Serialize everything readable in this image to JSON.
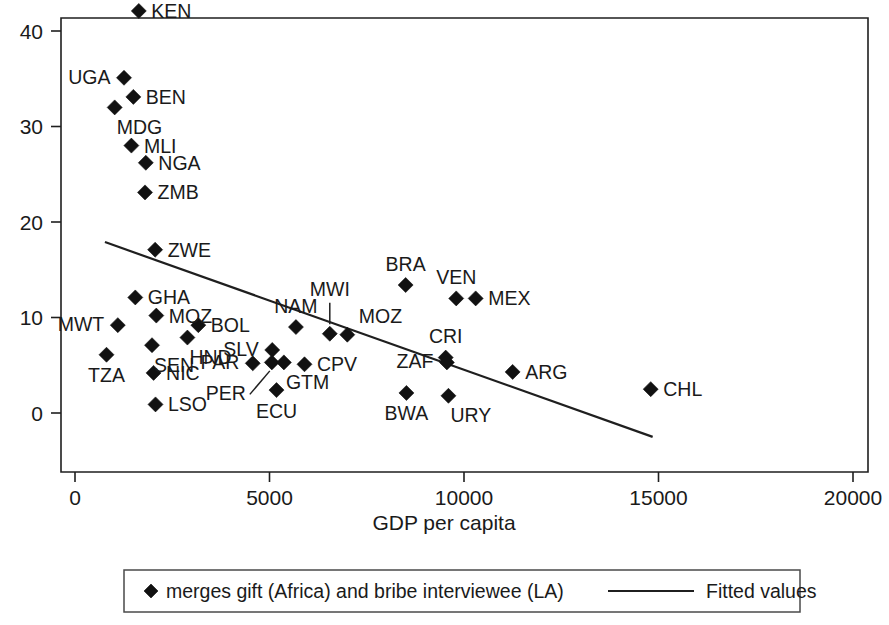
{
  "chart_data": {
    "type": "scatter",
    "title": "",
    "xlabel": "GDP per capita",
    "ylabel": "",
    "xlim": [
      0,
      20000
    ],
    "ylim": [
      -4,
      44
    ],
    "grid": false,
    "xticks": [
      0,
      5000,
      10000,
      15000,
      20000
    ],
    "xticklabels": [
      "0",
      "5000",
      "10000",
      "15000",
      "20000"
    ],
    "yticks": [
      0,
      10,
      20,
      30,
      40
    ],
    "yticklabels": [
      "0",
      "10",
      "20",
      "30",
      "40"
    ],
    "legend_position": "bottom-outside",
    "series": [
      {
        "name": "merges gift (Africa) and bribe interviewee (LA)",
        "marker": "diamond",
        "points": [
          {
            "label": "KEN",
            "x": 1640,
            "y": 42.1,
            "label_pos": "right"
          },
          {
            "label": "UGA",
            "x": 1260,
            "y": 35.1,
            "label_pos": "left"
          },
          {
            "label": "BEN",
            "x": 1500,
            "y": 33.1,
            "label_pos": "right"
          },
          {
            "label": "MDG",
            "x": 1020,
            "y": 32.0,
            "label_pos": "below-right"
          },
          {
            "label": "MLI",
            "x": 1450,
            "y": 28.0,
            "label_pos": "right"
          },
          {
            "label": "NGA",
            "x": 1820,
            "y": 26.2,
            "label_pos": "right"
          },
          {
            "label": "ZMB",
            "x": 1800,
            "y": 23.1,
            "label_pos": "right"
          },
          {
            "label": "ZWE",
            "x": 2060,
            "y": 17.1,
            "label_pos": "right"
          },
          {
            "label": "GHA",
            "x": 1550,
            "y": 12.1,
            "label_pos": "right"
          },
          {
            "label": "MOZ",
            "x": 2090,
            "y": 10.2,
            "label_pos": "right"
          },
          {
            "label": "MWT",
            "x": 1100,
            "y": 9.2,
            "label_pos": "left"
          },
          {
            "label": "BOL",
            "x": 3170,
            "y": 9.2,
            "label_pos": "right"
          },
          {
            "label": "NAM",
            "x": 5680,
            "y": 9.0,
            "label_pos": "above"
          },
          {
            "label": "HND",
            "x": 2890,
            "y": 7.9,
            "label_pos": "below-right"
          },
          {
            "label": "SEN",
            "x": 1980,
            "y": 7.1,
            "label_pos": "below-right"
          },
          {
            "label": "SLV",
            "x": 5070,
            "y": 6.6,
            "label_pos": "left"
          },
          {
            "label": "TZA",
            "x": 810,
            "y": 6.1,
            "label_pos": "below"
          },
          {
            "label": "MWI",
            "x": 6550,
            "y": 8.3,
            "label_pos": "above-leader"
          },
          {
            "label": "MOZ",
            "x": 7000,
            "y": 8.2,
            "label_pos": "above-right"
          },
          {
            "label": "NIC",
            "x": 2020,
            "y": 4.2,
            "label_pos": "right"
          },
          {
            "label": "PAR",
            "x": 4570,
            "y": 5.2,
            "label_pos": "left"
          },
          {
            "label": "PER",
            "x": 5060,
            "y": 5.3,
            "label_pos": "below-leader"
          },
          {
            "label": "GTM",
            "x": 5370,
            "y": 5.3,
            "label_pos": "below-right"
          },
          {
            "label": "CPV",
            "x": 5900,
            "y": 5.1,
            "label_pos": "right"
          },
          {
            "label": "ECU",
            "x": 5180,
            "y": 2.4,
            "label_pos": "below"
          },
          {
            "label": "LSO",
            "x": 2070,
            "y": 0.9,
            "label_pos": "right"
          },
          {
            "label": "CRI",
            "x": 9530,
            "y": 5.8,
            "label_pos": "above"
          },
          {
            "label": "ZAF",
            "x": 9560,
            "y": 5.3,
            "label_pos": "left"
          },
          {
            "label": "BWA",
            "x": 8520,
            "y": 2.1,
            "label_pos": "below"
          },
          {
            "label": "URY",
            "x": 9600,
            "y": 1.8,
            "label_pos": "below-right"
          },
          {
            "label": "BRA",
            "x": 8500,
            "y": 13.4,
            "label_pos": "above"
          },
          {
            "label": "VEN",
            "x": 9800,
            "y": 12.0,
            "label_pos": "above"
          },
          {
            "label": "MEX",
            "x": 10300,
            "y": 12.0,
            "label_pos": "right"
          },
          {
            "label": "ARG",
            "x": 11250,
            "y": 4.3,
            "label_pos": "right"
          },
          {
            "label": "CHL",
            "x": 14800,
            "y": 2.5,
            "label_pos": "right"
          }
        ]
      }
    ],
    "fit_line": {
      "name": "Fitted values",
      "x_start": 770,
      "y_start": 17.9,
      "x_end": 14850,
      "y_end": -2.5
    }
  },
  "legend": {
    "marker_label": "merges gift (Africa) and bribe interviewee (LA)",
    "line_label": "Fitted values"
  },
  "axes": {
    "x_title": "GDP per capita"
  }
}
